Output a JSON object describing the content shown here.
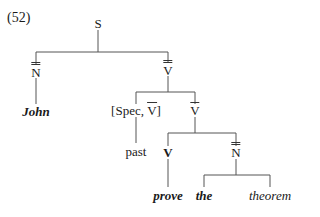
{
  "example_number": "(52)",
  "tree": {
    "root": "S",
    "nodes": {
      "s": "S",
      "nbar2_subject": "N",
      "john": "John",
      "vbar2": "V",
      "spec_prefix": "[Spec, ",
      "spec_v": "V",
      "spec_suffix": "]",
      "past": "past",
      "vbar": "V",
      "v": "V",
      "nbar2_object": "N",
      "prove": "prove",
      "the": "the",
      "theorem": "theorem"
    }
  }
}
